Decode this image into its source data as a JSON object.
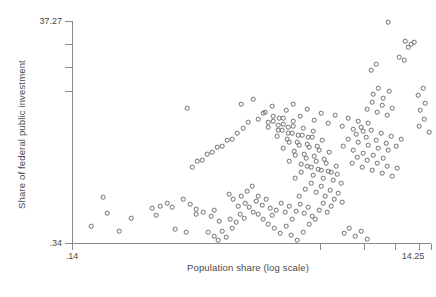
{
  "chart_data": {
    "type": "scatter",
    "title": "",
    "xlabel": "Population share (log scale)",
    "ylabel": "Share of federal public investment",
    "grid": false,
    "legend": null,
    "xtick_labels": [
      ".14",
      "14.25"
    ],
    "ytick_labels": [
      ".34",
      "37.27"
    ],
    "xlim": [
      0.14,
      14.25
    ],
    "ylim": [
      0.34,
      37.27
    ],
    "xscale": "log",
    "yscale": "log",
    "marker": "open-circle",
    "marker_color": "#6d6d6d",
    "n_points": 214,
    "points_px": [
      [
        103,
        197
      ],
      [
        91,
        226
      ],
      [
        119,
        231
      ],
      [
        107,
        213
      ],
      [
        131,
        218
      ],
      [
        156,
        215
      ],
      [
        152,
        208
      ],
      [
        160,
        206
      ],
      [
        167,
        203
      ],
      [
        172,
        207
      ],
      [
        183,
        199
      ],
      [
        190,
        204
      ],
      [
        196,
        209
      ],
      [
        175,
        229
      ],
      [
        186,
        232
      ],
      [
        196,
        214
      ],
      [
        203,
        212
      ],
      [
        211,
        216
      ],
      [
        214,
        210
      ],
      [
        219,
        221
      ],
      [
        208,
        232
      ],
      [
        214,
        236
      ],
      [
        222,
        231
      ],
      [
        218,
        240
      ],
      [
        226,
        237
      ],
      [
        232,
        228
      ],
      [
        230,
        219
      ],
      [
        236,
        222
      ],
      [
        240,
        214
      ],
      [
        244,
        218
      ],
      [
        238,
        206
      ],
      [
        245,
        203
      ],
      [
        233,
        199
      ],
      [
        229,
        194
      ],
      [
        241,
        196
      ],
      [
        249,
        207
      ],
      [
        253,
        212
      ],
      [
        256,
        201
      ],
      [
        247,
        191
      ],
      [
        252,
        186
      ],
      [
        258,
        196
      ],
      [
        262,
        205
      ],
      [
        266,
        199
      ],
      [
        270,
        208
      ],
      [
        258,
        214
      ],
      [
        263,
        219
      ],
      [
        268,
        224
      ],
      [
        272,
        215
      ],
      [
        276,
        210
      ],
      [
        281,
        203
      ],
      [
        285,
        212
      ],
      [
        289,
        206
      ],
      [
        274,
        228
      ],
      [
        280,
        233
      ],
      [
        286,
        226
      ],
      [
        292,
        219
      ],
      [
        296,
        211
      ],
      [
        300,
        204
      ],
      [
        304,
        213
      ],
      [
        308,
        207
      ],
      [
        312,
        216
      ],
      [
        291,
        235
      ],
      [
        297,
        240
      ],
      [
        303,
        232
      ],
      [
        309,
        224
      ],
      [
        315,
        219
      ],
      [
        319,
        210
      ],
      [
        323,
        203
      ],
      [
        327,
        212
      ],
      [
        331,
        206
      ],
      [
        299,
        196
      ],
      [
        305,
        189
      ],
      [
        311,
        183
      ],
      [
        316,
        192
      ],
      [
        321,
        186
      ],
      [
        325,
        196
      ],
      [
        330,
        190
      ],
      [
        334,
        199
      ],
      [
        338,
        193
      ],
      [
        342,
        202
      ],
      [
        295,
        178
      ],
      [
        301,
        172
      ],
      [
        307,
        166
      ],
      [
        313,
        175
      ],
      [
        318,
        169
      ],
      [
        323,
        178
      ],
      [
        328,
        171
      ],
      [
        333,
        180
      ],
      [
        337,
        174
      ],
      [
        341,
        183
      ],
      [
        289,
        161
      ],
      [
        295,
        155
      ],
      [
        301,
        164
      ],
      [
        306,
        158
      ],
      [
        311,
        167
      ],
      [
        316,
        161
      ],
      [
        321,
        170
      ],
      [
        326,
        163
      ],
      [
        331,
        172
      ],
      [
        336,
        166
      ],
      [
        283,
        148
      ],
      [
        289,
        142
      ],
      [
        294,
        151
      ],
      [
        299,
        145
      ],
      [
        304,
        154
      ],
      [
        309,
        147
      ],
      [
        314,
        156
      ],
      [
        319,
        150
      ],
      [
        324,
        159
      ],
      [
        329,
        152
      ],
      [
        277,
        136
      ],
      [
        282,
        130
      ],
      [
        287,
        139
      ],
      [
        292,
        133
      ],
      [
        297,
        142
      ],
      [
        302,
        135
      ],
      [
        307,
        144
      ],
      [
        312,
        137
      ],
      [
        317,
        146
      ],
      [
        322,
        140
      ],
      [
        268,
        127
      ],
      [
        273,
        121
      ],
      [
        278,
        130
      ],
      [
        283,
        124
      ],
      [
        288,
        133
      ],
      [
        293,
        126
      ],
      [
        298,
        135
      ],
      [
        303,
        128
      ],
      [
        308,
        137
      ],
      [
        313,
        131
      ],
      [
        258,
        119
      ],
      [
        263,
        113
      ],
      [
        268,
        122
      ],
      [
        273,
        116
      ],
      [
        278,
        125
      ],
      [
        283,
        118
      ],
      [
        288,
        127
      ],
      [
        293,
        121
      ],
      [
        243,
        128
      ],
      [
        248,
        122
      ],
      [
        232,
        139
      ],
      [
        237,
        133
      ],
      [
        222,
        146
      ],
      [
        227,
        140
      ],
      [
        212,
        152
      ],
      [
        217,
        147
      ],
      [
        202,
        160
      ],
      [
        207,
        154
      ],
      [
        192,
        167
      ],
      [
        197,
        161
      ],
      [
        187,
        108
      ],
      [
        241,
        104
      ],
      [
        253,
        99
      ],
      [
        265,
        112
      ],
      [
        272,
        106
      ],
      [
        279,
        118
      ],
      [
        286,
        110
      ],
      [
        293,
        104
      ],
      [
        300,
        116
      ],
      [
        307,
        109
      ],
      [
        314,
        120
      ],
      [
        321,
        113
      ],
      [
        328,
        123
      ],
      [
        335,
        115
      ],
      [
        342,
        126
      ],
      [
        348,
        118
      ],
      [
        353,
        129
      ],
      [
        358,
        121
      ],
      [
        363,
        131
      ],
      [
        368,
        123
      ],
      [
        343,
        146
      ],
      [
        348,
        139
      ],
      [
        353,
        150
      ],
      [
        358,
        142
      ],
      [
        363,
        153
      ],
      [
        368,
        145
      ],
      [
        373,
        155
      ],
      [
        378,
        148
      ],
      [
        383,
        158
      ],
      [
        388,
        150
      ],
      [
        352,
        163
      ],
      [
        357,
        157
      ],
      [
        362,
        167
      ],
      [
        367,
        160
      ],
      [
        372,
        170
      ],
      [
        377,
        163
      ],
      [
        382,
        173
      ],
      [
        387,
        166
      ],
      [
        392,
        176
      ],
      [
        397,
        168
      ],
      [
        356,
        134
      ],
      [
        361,
        127
      ],
      [
        366,
        137
      ],
      [
        371,
        130
      ],
      [
        376,
        140
      ],
      [
        381,
        133
      ],
      [
        386,
        143
      ],
      [
        391,
        136
      ],
      [
        396,
        146
      ],
      [
        401,
        139
      ],
      [
        367,
        109
      ],
      [
        372,
        102
      ],
      [
        377,
        112
      ],
      [
        382,
        105
      ],
      [
        387,
        115
      ],
      [
        392,
        108
      ],
      [
        373,
        94
      ],
      [
        378,
        88
      ],
      [
        383,
        98
      ],
      [
        389,
        91
      ],
      [
        388,
        22
      ],
      [
        405,
        41
      ],
      [
        411,
        44
      ],
      [
        408,
        47
      ],
      [
        414,
        42
      ],
      [
        371,
        70
      ],
      [
        376,
        64
      ],
      [
        399,
        57
      ],
      [
        404,
        60
      ],
      [
        418,
        95
      ],
      [
        423,
        88
      ],
      [
        420,
        110
      ],
      [
        425,
        103
      ],
      [
        419,
        126
      ],
      [
        424,
        119
      ],
      [
        429,
        132
      ],
      [
        355,
        236
      ],
      [
        361,
        231
      ],
      [
        367,
        239
      ],
      [
        349,
        228
      ],
      [
        344,
        233
      ]
    ]
  }
}
